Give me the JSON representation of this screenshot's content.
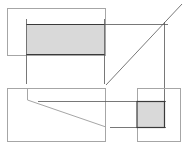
{
  "diagram": {
    "title": "",
    "colors": {
      "box_stroke": "#a6a6a6",
      "line_stroke": "#555555",
      "shade_fill": "#d9d9d9",
      "shade_edge": "#3a3a3a",
      "background": "#ffffff"
    },
    "views": [
      {
        "name": "top-view",
        "box": [
          7,
          8,
          99,
          47
        ],
        "shaded": [
          26,
          24,
          78,
          30
        ]
      },
      {
        "name": "front-view",
        "box": [
          7,
          88,
          99,
          53
        ]
      },
      {
        "name": "side-view",
        "box": [
          137,
          88,
          44,
          53
        ],
        "shaded": [
          137,
          101,
          28,
          26
        ]
      }
    ],
    "miter_line": {
      "x1": 106,
      "y1": 85,
      "x2": 182,
      "y2": 4
    }
  }
}
